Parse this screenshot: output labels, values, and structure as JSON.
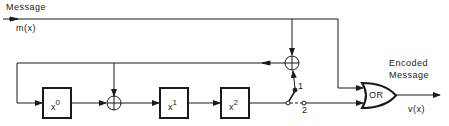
{
  "diagram": {
    "input": {
      "title": "Message",
      "signal": "m(x)"
    },
    "output": {
      "title_line1": "Encoded",
      "title_line2": "Message",
      "signal": "v(x)"
    },
    "registers": [
      {
        "base": "x",
        "exp": "0"
      },
      {
        "base": "x",
        "exp": "1"
      },
      {
        "base": "x",
        "exp": "2"
      }
    ],
    "gate": {
      "label": "OR"
    },
    "switch": {
      "pos1": "1",
      "pos2": "2"
    },
    "adders": [
      {
        "symbol": "⊕",
        "position": "feedback"
      },
      {
        "symbol": "⊕",
        "position": "between x0 and x1"
      }
    ],
    "colors": {
      "ink": "#1a1a1a",
      "background": "#ffffff"
    }
  }
}
